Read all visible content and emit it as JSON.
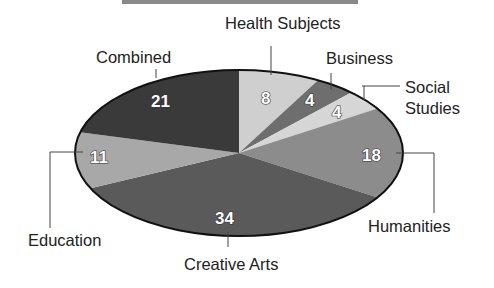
{
  "header": {
    "bar_color": "#8a8a8a"
  },
  "chart_data": {
    "type": "pie",
    "title": "",
    "categories": [
      "Health Subjects",
      "Business",
      "Social Studies",
      "Humanities",
      "Creative Arts",
      "Education",
      "Combined"
    ],
    "values": [
      8,
      4,
      4,
      18,
      34,
      11,
      21
    ],
    "colors": [
      "#cfcfcf",
      "#6e6e6e",
      "#d6d6d6",
      "#8c8c8c",
      "#5a5a5a",
      "#a8a8a8",
      "#3a3a3a"
    ],
    "labels": {
      "health": "Health Subjects",
      "business": "Business",
      "social_line1": "Social",
      "social_line2": "Studies",
      "humanities": "Humanities",
      "creative": "Creative Arts",
      "education": "Education",
      "combined": "Combined"
    },
    "value_labels": {
      "health": "8",
      "business": "4",
      "social": "4",
      "humanities": "18",
      "creative": "34",
      "education": "11",
      "combined": "21"
    },
    "legend": "none (callout labels)",
    "total": 100
  }
}
